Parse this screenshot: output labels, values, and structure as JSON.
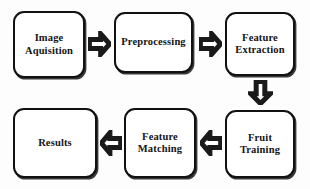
{
  "diagram": {
    "type": "flowchart",
    "background_color": "#fdfdfd",
    "node_border_color": "#111111",
    "node_fill_color": "#ffffff",
    "arrow_outline_color": "#1a1a1a",
    "nodes": [
      {
        "id": "image-aquisition",
        "label": "Image\nAquisition",
        "row": 1,
        "column": 1
      },
      {
        "id": "preprocessing",
        "label": "Preprocessing",
        "row": 1,
        "column": 2
      },
      {
        "id": "feature-extraction",
        "label": "Feature\nExtraction",
        "row": 1,
        "column": 3
      },
      {
        "id": "fruit-training",
        "label": "Fruit\nTraining",
        "row": 2,
        "column": 3
      },
      {
        "id": "feature-matching",
        "label": "Feature\nMatching",
        "row": 2,
        "column": 2
      },
      {
        "id": "results",
        "label": "Results",
        "row": 2,
        "column": 1
      }
    ],
    "arrows": [
      {
        "id": "arrow-1",
        "direction": "right",
        "from": "image-aquisition",
        "to": "preprocessing"
      },
      {
        "id": "arrow-2",
        "direction": "right",
        "from": "preprocessing",
        "to": "feature-extraction"
      },
      {
        "id": "arrow-3",
        "direction": "down",
        "from": "feature-extraction",
        "to": "fruit-training"
      },
      {
        "id": "arrow-4",
        "direction": "left",
        "from": "fruit-training",
        "to": "feature-matching"
      },
      {
        "id": "arrow-5",
        "direction": "left",
        "from": "feature-matching",
        "to": "results"
      }
    ]
  }
}
